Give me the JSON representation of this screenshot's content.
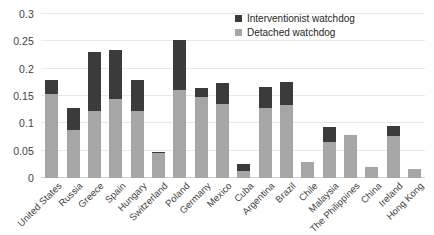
{
  "chart_data": {
    "type": "bar",
    "subtype": "stacked-vertical",
    "title": "",
    "xlabel": "",
    "ylabel": "",
    "ylim": [
      0,
      0.3
    ],
    "yticks": [
      "0",
      "0.05",
      "0.1",
      "0.15",
      "0.2",
      "0.25",
      "0.3"
    ],
    "ytick_values": [
      0,
      0.05,
      0.1,
      0.15,
      0.2,
      0.25,
      0.3
    ],
    "grid": true,
    "grid_axis": "y",
    "legend_position": "top-right",
    "categories": [
      "United States",
      "Russia",
      "Greece",
      "Spain",
      "Hungary",
      "Switzerland",
      "Poland",
      "Germany",
      "Mexico",
      "Cuba",
      "Argentina",
      "Brazil",
      "Chile",
      "Malaysia",
      "The Philippines",
      "China",
      "Ireland",
      "Hong Kong"
    ],
    "series": [
      {
        "name": "Detached watchdog",
        "color": "#a6a6a6",
        "values": [
          0.154,
          0.087,
          0.122,
          0.145,
          0.122,
          0.045,
          0.161,
          0.148,
          0.136,
          0.012,
          0.128,
          0.134,
          0.03,
          0.065,
          0.079,
          0.02,
          0.077,
          0.017
        ]
      },
      {
        "name": "Interventionist watchdog",
        "color": "#3b3b3b",
        "values": [
          0.025,
          0.041,
          0.108,
          0.089,
          0.058,
          0.003,
          0.091,
          0.017,
          0.037,
          0.013,
          0.038,
          0.042,
          0.0,
          0.028,
          0.0,
          0.0,
          0.019,
          0.0
        ]
      }
    ],
    "totals": [
      0.179,
      0.128,
      0.23,
      0.234,
      0.18,
      0.048,
      0.252,
      0.165,
      0.173,
      0.025,
      0.166,
      0.176,
      0.03,
      0.093,
      0.079,
      0.02,
      0.096,
      0.017
    ]
  },
  "legend": {
    "items": [
      {
        "label": "Interventionist watchdog",
        "swatch": "interventionist"
      },
      {
        "label": "Detached watchdog",
        "swatch": "detached"
      }
    ]
  }
}
